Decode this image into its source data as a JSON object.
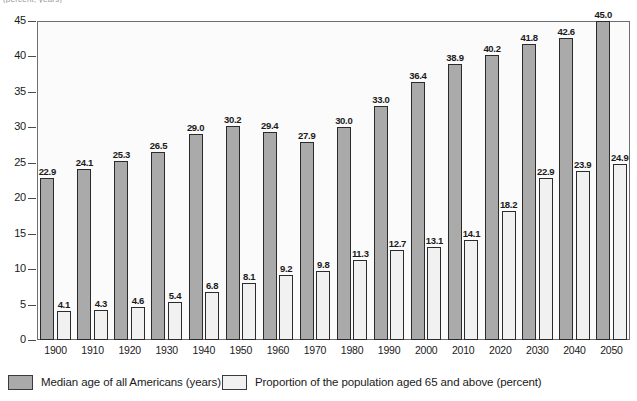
{
  "top_caption": "(percent, years)",
  "chart_data": {
    "type": "bar",
    "title": "",
    "subtitle": "",
    "xlabel": "",
    "ylabel": "",
    "ylim": [
      0,
      45
    ],
    "yticks": [
      0,
      5,
      10,
      15,
      20,
      25,
      30,
      35,
      40,
      45
    ],
    "grid": false,
    "legend_position": "bottom",
    "categories": [
      "1900",
      "1910",
      "1920",
      "1930",
      "1940",
      "1950",
      "1960",
      "1970",
      "1980",
      "1990",
      "2000",
      "2010",
      "2020",
      "2030",
      "2040",
      "2050"
    ],
    "series": [
      {
        "name": "Median age of all Americans (years)",
        "color": "#aaaaaa",
        "values": [
          22.9,
          24.1,
          25.3,
          26.5,
          29.0,
          30.2,
          29.4,
          27.9,
          30.0,
          33.0,
          36.4,
          38.9,
          40.2,
          41.8,
          42.6,
          45.0
        ]
      },
      {
        "name": "Proportion of the population aged 65 and above (percent)",
        "color": "#f1f1f1",
        "values": [
          4.1,
          4.3,
          4.6,
          5.4,
          6.8,
          8.1,
          9.2,
          9.8,
          11.3,
          12.7,
          13.1,
          14.1,
          18.2,
          22.9,
          23.9,
          24.9
        ]
      }
    ]
  },
  "legend": {
    "items": [
      {
        "label": "Median age of all Americans (years)",
        "swatch": "series-a"
      },
      {
        "label": "Proportion of the population aged 65 and above (percent)",
        "swatch": "series-b"
      }
    ]
  },
  "colors": {
    "series_a": "#aaaaaa",
    "series_b": "#f1f1f1",
    "bar_outline": "#2b2b2b",
    "frame": "#6e6e6e",
    "plot_background": "#fbfbfb",
    "text": "#1a1a1a"
  }
}
